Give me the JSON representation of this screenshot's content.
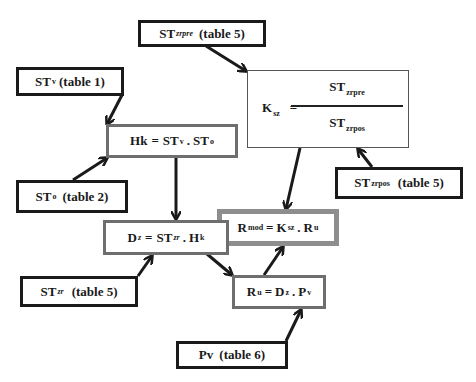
{
  "diagram": {
    "title": "",
    "nodes": {
      "st_zrpre": {
        "base": "ST",
        "sub": "zrpre",
        "suffix": "(table 5)"
      },
      "st_v": {
        "base": "ST",
        "sub": "v",
        "suffix": "(table 1)"
      },
      "hk": {
        "lhs": "Hk",
        "eq": "=",
        "t1": "ST",
        "t1sub": "v",
        "op": ".",
        "t2": "ST",
        "t2sub": "o"
      },
      "ksz": {
        "lhs": "K",
        "lhssub": "sz",
        "eq": "=",
        "num": "ST",
        "numsub": "zrpre",
        "den": "ST",
        "densub": "zrpos"
      },
      "st_o": {
        "base": "ST",
        "sub": "o",
        "suffix": "(table 2)"
      },
      "st_zrpos": {
        "base": "ST",
        "sub": "zrpos",
        "suffix": "(table 5)"
      },
      "dz": {
        "lhs": "D",
        "lhssub": "z",
        "eq": "=",
        "t1": "ST",
        "t1sub": "zr",
        "op": ".",
        "t2": "H",
        "t2sub": "k"
      },
      "rmod": {
        "lhs": "R",
        "lhssub": "mod",
        "eq": "=",
        "t1": "K",
        "t1sub": "sz",
        "op": ".",
        "t2": "R",
        "t2sub": "u"
      },
      "st_zr": {
        "base": "ST",
        "sub": "zr",
        "suffix": "(table 5)"
      },
      "ru": {
        "lhs": "R",
        "lhssub": "u",
        "eq": "=",
        "t1": "D",
        "t1sub": "z",
        "op": ".",
        "t2": "P",
        "t2sub": "v"
      },
      "pv": {
        "base": "Pv",
        "suffix": "(table 6)"
      }
    },
    "edges": [
      {
        "from": "st_zrpre",
        "to": "ksz"
      },
      {
        "from": "st_v",
        "to": "hk"
      },
      {
        "from": "st_o",
        "to": "hk"
      },
      {
        "from": "hk",
        "to": "dz"
      },
      {
        "from": "st_zrpos",
        "to": "ksz"
      },
      {
        "from": "ksz",
        "to": "rmod"
      },
      {
        "from": "st_zr",
        "to": "dz"
      },
      {
        "from": "dz",
        "to": "ru"
      },
      {
        "from": "ru",
        "to": "rmod"
      },
      {
        "from": "pv",
        "to": "ru"
      }
    ],
    "colors": {
      "source_border": "#1a1a1a",
      "calc_border": "#6e6e6e",
      "result_border": "#8e8e8e",
      "arrow": "#1a1a1a"
    }
  }
}
